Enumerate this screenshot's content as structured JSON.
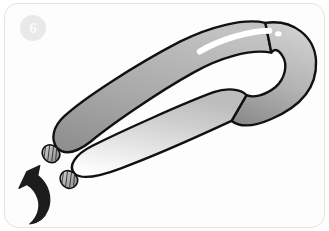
{
  "card": {
    "step_badge": {
      "number": "6",
      "background_color": "#e9e9e9",
      "text_color": "#fbfbfb"
    },
    "background_color": "#fdfdfd",
    "border_color": "#e3e3e3"
  },
  "illustration": {
    "title": "Balloon folded into a long loop with two nozzle ends",
    "subject": "modelling-balloon",
    "colors": {
      "outline": "#111111",
      "balloon_light": "#f2f2f2",
      "balloon_mid": "#c9c9c9",
      "balloon_dark": "#8d8d8d",
      "highlight": "#ffffff",
      "arrow": "#1c1c1c",
      "nozzle_fill": "#b0b0b0"
    },
    "parts": {
      "upper_tube_label": "upper balloon tube",
      "lower_tube_label": "lower balloon tube",
      "loop_bend_label": "balloon loop bend",
      "highlight_streak_label": "balloon gloss highlight",
      "highlight_dot_label": "balloon gloss dot",
      "upper_nozzle_label": "upper balloon nozzle",
      "lower_nozzle_label": "lower balloon nozzle",
      "arrow_label": "counter-clockwise twist arrow"
    }
  }
}
